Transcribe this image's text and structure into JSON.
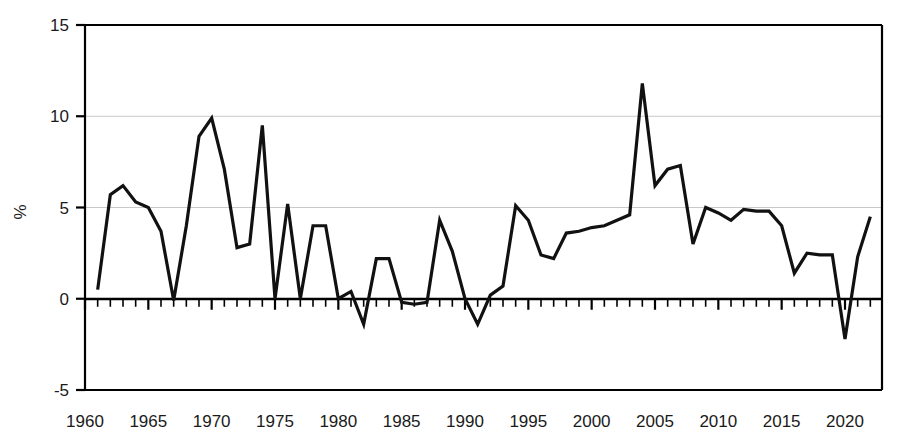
{
  "chart_data": {
    "type": "line",
    "title": "",
    "xlabel": "",
    "ylabel": "%",
    "xlim": [
      1961,
      2022
    ],
    "ylim": [
      -5,
      15
    ],
    "yticks": [
      -5,
      0,
      5,
      10,
      15
    ],
    "ytick_labels": [
      "-5",
      "0",
      "5",
      "10",
      "15"
    ],
    "xticks": [
      1960,
      1965,
      1970,
      1975,
      1980,
      1985,
      1990,
      1995,
      2000,
      2005,
      2010,
      2015,
      2020
    ],
    "xtick_labels": [
      "1960",
      "1965",
      "1970",
      "1975",
      "1980",
      "1985",
      "1990",
      "1995",
      "2000",
      "2005",
      "2010",
      "2015",
      "2020"
    ],
    "minor_xtick_interval": 1,
    "grid": "horizontal-at-5-and-10",
    "legend": "none",
    "line_color": "#111111",
    "grid_color": "#c9c9c9",
    "axis_color": "#000000",
    "series": [
      {
        "name": "annual growth",
        "x": [
          1961,
          1962,
          1963,
          1964,
          1965,
          1966,
          1967,
          1968,
          1969,
          1970,
          1971,
          1972,
          1973,
          1974,
          1975,
          1976,
          1977,
          1978,
          1979,
          1980,
          1981,
          1982,
          1983,
          1984,
          1985,
          1986,
          1987,
          1988,
          1989,
          1990,
          1991,
          1992,
          1993,
          1994,
          1995,
          1996,
          1997,
          1998,
          1999,
          2000,
          2001,
          2002,
          2003,
          2004,
          2005,
          2006,
          2007,
          2008,
          2009,
          2010,
          2011,
          2012,
          2013,
          2014,
          2015,
          2016,
          2017,
          2018,
          2019,
          2020,
          2021,
          2022
        ],
        "values": [
          0.5,
          5.7,
          6.2,
          5.3,
          5.0,
          3.7,
          -0.1,
          4.0,
          8.9,
          9.9,
          7.1,
          2.8,
          3.0,
          9.5,
          0.0,
          5.2,
          0.0,
          4.0,
          4.0,
          0.0,
          0.4,
          -1.4,
          2.2,
          2.2,
          -0.2,
          -0.3,
          -0.2,
          4.3,
          2.6,
          0.0,
          -1.4,
          0.2,
          0.7,
          5.1,
          4.3,
          2.4,
          2.2,
          3.6,
          3.7,
          3.9,
          4.0,
          4.3,
          4.6,
          11.8,
          6.2,
          7.1,
          7.3,
          3.0,
          5.0,
          4.7,
          4.3,
          4.9,
          4.8,
          4.8,
          4.0,
          1.4,
          2.5,
          2.4,
          2.4,
          -2.2,
          2.3,
          4.5
        ]
      }
    ]
  },
  "axis": {
    "y_label": "%"
  }
}
